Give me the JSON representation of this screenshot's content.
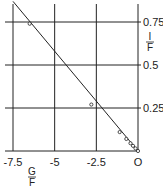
{
  "chart_data": {
    "type": "scatter",
    "title": "",
    "xlabel": "G/F",
    "ylabel": "I/F",
    "xlabel_num": "G",
    "xlabel_den": "F",
    "ylabel_num": "I",
    "ylabel_den": "F",
    "xlim": [
      -7.5,
      0
    ],
    "ylim": [
      0,
      0.88
    ],
    "x_ticks": [
      -7.5,
      -5,
      -2.5,
      0
    ],
    "x_tick_labels": [
      "-7.5",
      "-5",
      "-2.5",
      "O"
    ],
    "y_ticks": [
      0.25,
      0.5,
      0.75
    ],
    "y_tick_labels": [
      "0.25",
      "0.5",
      "0.75"
    ],
    "y_axis_position": "right",
    "grid": true,
    "series": [
      {
        "name": "observed",
        "marker": "open-circle",
        "points": [
          {
            "x": -6.5,
            "y": 0.74
          },
          {
            "x": -2.8,
            "y": 0.27
          },
          {
            "x": -1.1,
            "y": 0.11
          },
          {
            "x": -0.7,
            "y": 0.07
          },
          {
            "x": -0.45,
            "y": 0.045
          },
          {
            "x": -0.3,
            "y": 0.03
          },
          {
            "x": -0.15,
            "y": 0.015
          },
          {
            "x": 0,
            "y": 0
          }
        ]
      },
      {
        "name": "fit-line",
        "type": "line",
        "points": [
          {
            "x": -7.5,
            "y": 0.87
          },
          {
            "x": 0,
            "y": 0
          }
        ]
      }
    ]
  },
  "colors": {
    "ink": "#222222",
    "grid": "#222222",
    "background": "#ffffff"
  }
}
